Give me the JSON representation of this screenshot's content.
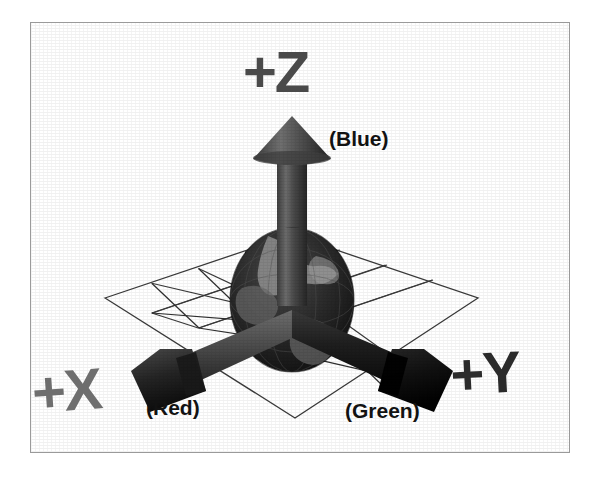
{
  "figure": {
    "background_color": "#ffffff",
    "frame_color": "#9a9a9a"
  },
  "labels": {
    "axis_z": "+Z",
    "axis_x": "+X",
    "axis_y": "+Y",
    "color_z": "(Blue)",
    "color_x": "(Red)",
    "color_y": "(Green)"
  },
  "colors": {
    "axis_z_label": "#4a4a4a",
    "axis_x_label": "#6e6e6e",
    "axis_y_label": "#2b2b2b",
    "color_label": "#121212",
    "arrow_z": "#5a5a5a",
    "arrow_x": "#4f4f4f",
    "arrow_y": "#1c1c1c",
    "globe": "#2a2a2a",
    "grid_line": "#3a3a3a"
  },
  "scene": {
    "origin": {
      "x": 292,
      "y": 300
    },
    "globe": {
      "cx": 292,
      "cy": 300,
      "rx": 62,
      "ry": 72
    },
    "grid": {
      "rows": 4,
      "cols": 4,
      "left_vertex": {
        "x": 105,
        "y": 298
      },
      "right_vertex": {
        "x": 478,
        "y": 298
      },
      "top_vertex": {
        "x": 292,
        "y": 235
      },
      "bottom_vertex": {
        "x": 295,
        "y": 418
      }
    },
    "axes": [
      {
        "name": "z-axis-arrow",
        "label": "+Z",
        "color_name": "(Blue)",
        "direction": "up",
        "tip": {
          "x": 292,
          "y": 116
        },
        "base": {
          "x": 292,
          "y": 300
        }
      },
      {
        "name": "x-axis-arrow",
        "label": "+X",
        "color_name": "(Red)",
        "direction": "down-left",
        "tip": {
          "x": 148,
          "y": 388
        },
        "base": {
          "x": 292,
          "y": 320
        }
      },
      {
        "name": "y-axis-arrow",
        "label": "+Y",
        "color_name": "(Green)",
        "direction": "down-right",
        "tip": {
          "x": 432,
          "y": 388
        },
        "base": {
          "x": 292,
          "y": 320
        }
      }
    ]
  }
}
